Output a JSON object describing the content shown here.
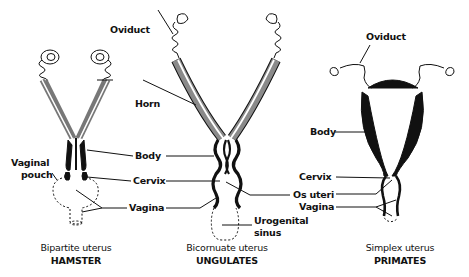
{
  "figure": {
    "panels": [
      {
        "id": "hamster",
        "caption_type": "Bipartite uterus",
        "caption_group": "HAMSTER",
        "labels": [
          "Vaginal",
          "pouch",
          "Horn",
          "Body",
          "Cervix",
          "Vagina"
        ]
      },
      {
        "id": "ungulates",
        "caption_type": "Bicornuate uterus",
        "caption_group": "UNGULATES",
        "labels": [
          "Oviduct",
          "Os uteri",
          "Urogenital",
          "sinus"
        ]
      },
      {
        "id": "primates",
        "caption_type": "Simplex uterus",
        "caption_group": "PRIMATES",
        "labels": [
          "Oviduct",
          "Body",
          "Cervix",
          "Vagina"
        ]
      }
    ],
    "colors": {
      "ink": "#111111",
      "horn_gray": "#8a8a8a",
      "background": "#ffffff"
    }
  }
}
